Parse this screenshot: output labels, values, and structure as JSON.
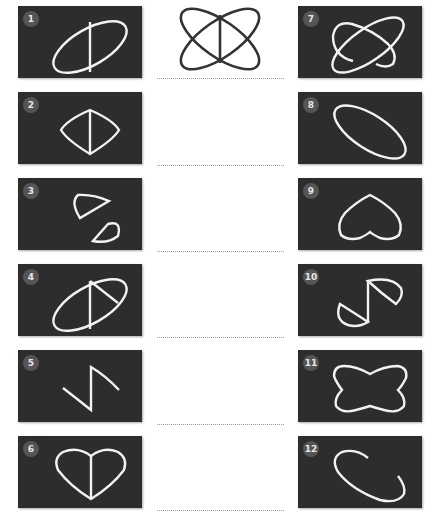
{
  "puzzle": {
    "target_figure": "overlapping-ellipses-with-vertical-line",
    "answer_lines": 6
  },
  "options": [
    {
      "number": "1",
      "shape": "ellipse-tilted-with-vertical-divider"
    },
    {
      "number": "2",
      "shape": "diamond-curved-with-vertical-divider"
    },
    {
      "number": "3",
      "shape": "two-half-ellipse-pieces"
    },
    {
      "number": "4",
      "shape": "ellipse-tilted-with-vertical-and-diagonal-divider"
    },
    {
      "number": "5",
      "shape": "zigzag-curve"
    },
    {
      "number": "6",
      "shape": "heart-with-vertical-divider"
    },
    {
      "number": "7",
      "shape": "two-overlapping-ellipses"
    },
    {
      "number": "8",
      "shape": "ellipse-tilted-down"
    },
    {
      "number": "9",
      "shape": "heart-inverted"
    },
    {
      "number": "10",
      "shape": "s-shape-half-pieces"
    },
    {
      "number": "11",
      "shape": "four-lobed-outline"
    },
    {
      "number": "12",
      "shape": "open-ellipse-arc"
    }
  ],
  "colors": {
    "panel_bg": "#2d2d2d",
    "stroke": "#f2f2f2",
    "target_stroke": "#333333",
    "badge_bg": "#555555"
  }
}
